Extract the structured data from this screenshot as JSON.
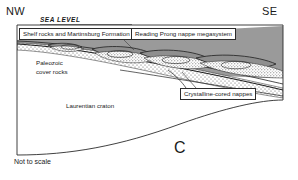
{
  "figure": {
    "panel_letter": "C",
    "scale_note": "Not to scale",
    "orientation_left": "NW",
    "orientation_right": "SE",
    "datum_label": "SEA LEVEL"
  },
  "labels": {
    "shelf_rocks": "Shelf rocks and Martinsburg Formation",
    "reading_prong": "Reading Prong nappe megasystem",
    "paleozoic_line1": "Paleozoic",
    "paleozoic_line2": "cover rocks",
    "crystalline_nappes": "Crystalline-cored nappes",
    "laurentian_craton": "Laurentian craton"
  },
  "nappe_letters": [
    "D",
    "C",
    "B",
    "A"
  ],
  "colors": {
    "ink": "#2b2b2b",
    "gray_fill": "#9a9a9a",
    "nappe_fill": "#8f8f8f",
    "stipple": "#555555",
    "background": "#ffffff"
  }
}
